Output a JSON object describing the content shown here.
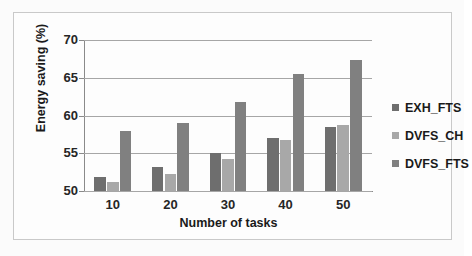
{
  "chart_data": {
    "type": "bar",
    "title": "",
    "xlabel": "Number of tasks",
    "ylabel": "Energy saving (%)",
    "categories": [
      "10",
      "20",
      "30",
      "40",
      "50"
    ],
    "ylim": [
      50,
      70
    ],
    "yticks": [
      "50",
      "55",
      "60",
      "65",
      "70"
    ],
    "grid": true,
    "legend_position": "right",
    "series": [
      {
        "name": "EXH_FTS",
        "color": "#6e6e6e",
        "values": [
          51.8,
          53.2,
          55.1,
          57.0,
          58.5
        ]
      },
      {
        "name": "DVFS_CH",
        "color": "#a8a8a8",
        "values": [
          51.2,
          52.3,
          54.2,
          56.7,
          58.7
        ]
      },
      {
        "name": "DVFS_FTS",
        "color": "#808080",
        "values": [
          58.0,
          59.0,
          61.8,
          65.5,
          67.4
        ]
      }
    ]
  },
  "figure": {
    "background": "#fbfbfb",
    "border_color": "#c9c9c9",
    "axis_color": "#8a8a8a",
    "gridline_color": "#a6a6a6"
  }
}
